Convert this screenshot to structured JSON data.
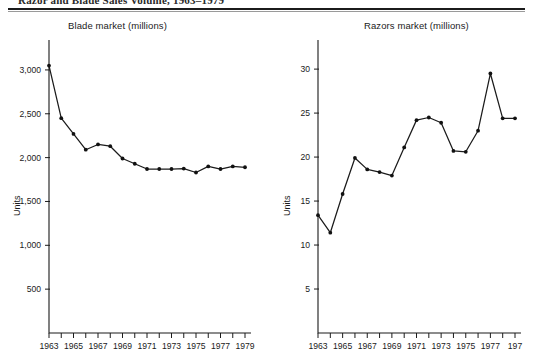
{
  "header": {
    "caption": "Razor and Blade Sales Volume, 1963–1979",
    "clipped": true
  },
  "charts": {
    "blade": {
      "title": "Blade market (millions)",
      "ylabel": "Units",
      "ytick_labels": [
        "500",
        "1,000",
        "1,500",
        "2,000",
        "2,500",
        "3,000"
      ],
      "xtick_labels": [
        "1963",
        "1965",
        "1967",
        "1969",
        "1971",
        "1973",
        "1975",
        "1977",
        "1979"
      ]
    },
    "razor": {
      "title": "Razors market (millions)",
      "ylabel": "Units",
      "ytick_labels": [
        "5",
        "10",
        "15",
        "20",
        "25",
        "30"
      ],
      "xtick_labels": [
        "1963",
        "1965",
        "1967",
        "1969",
        "1971",
        "1973",
        "1975",
        "1977",
        "197"
      ]
    }
  },
  "chart_data": [
    {
      "type": "line",
      "id": "blade-market",
      "title": "Blade market (millions)",
      "xlabel": "",
      "ylabel": "Units",
      "x": [
        1963,
        1964,
        1965,
        1966,
        1967,
        1968,
        1969,
        1970,
        1971,
        1972,
        1973,
        1974,
        1975,
        1976,
        1977,
        1978,
        1979
      ],
      "values": [
        3050,
        2450,
        2270,
        2090,
        2150,
        2130,
        1990,
        1930,
        1870,
        1870,
        1870,
        1875,
        1830,
        1900,
        1870,
        1900,
        1890
      ],
      "ylim": [
        0,
        3200
      ],
      "yticks": [
        500,
        1000,
        1500,
        2000,
        2500,
        3000
      ],
      "xlim": [
        1963,
        1979
      ],
      "xticks": [
        1963,
        1964,
        1965,
        1966,
        1967,
        1968,
        1969,
        1970,
        1971,
        1972,
        1973,
        1974,
        1975,
        1976,
        1977,
        1978,
        1979
      ],
      "xtick_labeled": [
        1963,
        1965,
        1967,
        1969,
        1971,
        1973,
        1975,
        1977,
        1979
      ],
      "grid": false,
      "legend": false,
      "marker": "filled-circle"
    },
    {
      "type": "line",
      "id": "razors-market",
      "title": "Razors market (millions)",
      "xlabel": "",
      "ylabel": "Units",
      "x": [
        1963,
        1964,
        1965,
        1966,
        1967,
        1968,
        1969,
        1970,
        1971,
        1972,
        1973,
        1974,
        1975,
        1976,
        1977,
        1978,
        1979
      ],
      "values": [
        13.4,
        11.4,
        15.8,
        19.9,
        18.6,
        18.3,
        17.9,
        21.1,
        24.2,
        24.5,
        23.9,
        20.7,
        20.6,
        23.0,
        29.5,
        24.4,
        24.4
      ],
      "ylim": [
        0,
        31.5
      ],
      "yticks": [
        5,
        10,
        15,
        20,
        25,
        30
      ],
      "xlim": [
        1963,
        1979
      ],
      "xticks": [
        1963,
        1964,
        1965,
        1966,
        1967,
        1968,
        1969,
        1970,
        1971,
        1972,
        1973,
        1974,
        1975,
        1976,
        1977,
        1978,
        1979
      ],
      "xtick_labeled": [
        1963,
        1965,
        1967,
        1969,
        1971,
        1973,
        1975,
        1977,
        1979
      ],
      "grid": false,
      "legend": false,
      "marker": "filled-circle"
    }
  ]
}
